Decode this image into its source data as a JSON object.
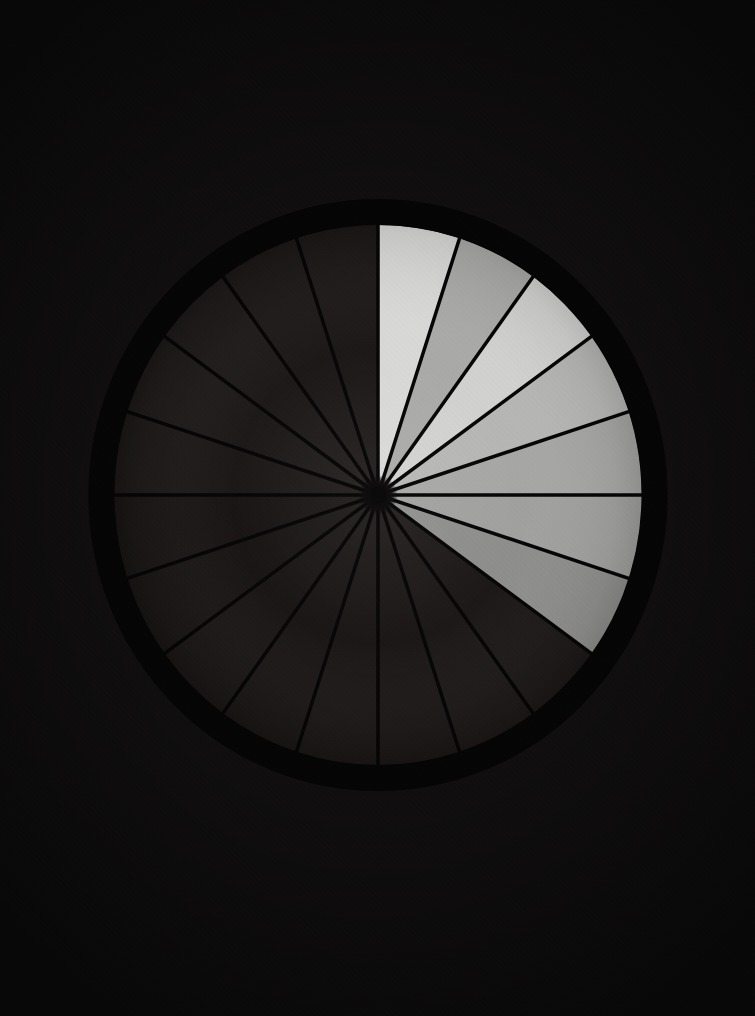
{
  "scene": {
    "title": "Radial sector wheel",
    "background_color": "#100e0e",
    "canvas_width": 755,
    "canvas_height": 1016
  },
  "wheel": {
    "center_x": 378,
    "center_y": 495,
    "rim_outer_rx": 289,
    "rim_outer_ry": 296,
    "rim_inner_rx": 264,
    "rim_inner_ry": 270,
    "rim_color": "#050404",
    "hub_radius": 9,
    "hub_color": "#060505",
    "sector_count": 20,
    "sector_span_degrees": 18,
    "spoke_color": "#050404",
    "spoke_width": 3.5,
    "dark_sector_color": "#1a1616"
  },
  "chart_data": {
    "type": "pie",
    "xlabel": "",
    "ylabel": "",
    "grid": false,
    "legend": "none",
    "total_sectors": 20,
    "slice_degrees": 18,
    "start_angle_degrees": -90,
    "direction": "clockwise",
    "categories": [
      "S1",
      "S2",
      "S3",
      "S4",
      "S5",
      "S6",
      "S7",
      "S8",
      "S9",
      "S10",
      "S11",
      "S12",
      "S13",
      "S14",
      "S15",
      "S16",
      "S17",
      "S18",
      "S19",
      "S20"
    ],
    "values": [
      18,
      18,
      18,
      18,
      18,
      18,
      18,
      18,
      18,
      18,
      18,
      18,
      18,
      18,
      18,
      18,
      18,
      18,
      18,
      18
    ],
    "lit_count": 7,
    "unlit_count": 13,
    "slices": [
      {
        "index": 1,
        "label": "S1",
        "start_deg": -90,
        "end_deg": -72,
        "lit": true,
        "color": "#d9d9d7",
        "brightness": 217
      },
      {
        "index": 2,
        "label": "S2",
        "start_deg": -72,
        "end_deg": -54,
        "lit": true,
        "color": "#a9a9a7",
        "brightness": 169
      },
      {
        "index": 3,
        "label": "S3",
        "start_deg": -54,
        "end_deg": -36,
        "lit": true,
        "color": "#d2d2d0",
        "brightness": 210
      },
      {
        "index": 4,
        "label": "S4",
        "start_deg": -36,
        "end_deg": -18,
        "lit": true,
        "color": "#b6b6b4",
        "brightness": 182
      },
      {
        "index": 5,
        "label": "S5",
        "start_deg": -18,
        "end_deg": 0,
        "lit": true,
        "color": "#a6a6a4",
        "brightness": 166
      },
      {
        "index": 6,
        "label": "S6",
        "start_deg": 0,
        "end_deg": 18,
        "lit": true,
        "color": "#a0a09e",
        "brightness": 160
      },
      {
        "index": 7,
        "label": "S7",
        "start_deg": 18,
        "end_deg": 36,
        "lit": true,
        "color": "#8d8d8b",
        "brightness": 141
      },
      {
        "index": 8,
        "label": "S8",
        "start_deg": 36,
        "end_deg": 54,
        "lit": false,
        "color": "#1a1616",
        "brightness": 26
      },
      {
        "index": 9,
        "label": "S9",
        "start_deg": 54,
        "end_deg": 72,
        "lit": false,
        "color": "#1a1616",
        "brightness": 26
      },
      {
        "index": 10,
        "label": "S10",
        "start_deg": 72,
        "end_deg": 90,
        "lit": false,
        "color": "#191515",
        "brightness": 25
      },
      {
        "index": 11,
        "label": "S11",
        "start_deg": 90,
        "end_deg": 108,
        "lit": false,
        "color": "#191515",
        "brightness": 25
      },
      {
        "index": 12,
        "label": "S12",
        "start_deg": 108,
        "end_deg": 126,
        "lit": false,
        "color": "#181414",
        "brightness": 24
      },
      {
        "index": 13,
        "label": "S13",
        "start_deg": 126,
        "end_deg": 144,
        "lit": false,
        "color": "#181414",
        "brightness": 24
      },
      {
        "index": 14,
        "label": "S14",
        "start_deg": 144,
        "end_deg": 162,
        "lit": false,
        "color": "#171313",
        "brightness": 23
      },
      {
        "index": 15,
        "label": "S15",
        "start_deg": 162,
        "end_deg": 180,
        "lit": false,
        "color": "#171313",
        "brightness": 23
      },
      {
        "index": 16,
        "label": "S16",
        "start_deg": 180,
        "end_deg": 198,
        "lit": false,
        "color": "#1a1616",
        "brightness": 26
      },
      {
        "index": 17,
        "label": "S17",
        "start_deg": 198,
        "end_deg": 216,
        "lit": false,
        "color": "#1b1717",
        "brightness": 27
      },
      {
        "index": 18,
        "label": "S18",
        "start_deg": 216,
        "end_deg": 234,
        "lit": false,
        "color": "#1b1717",
        "brightness": 27
      },
      {
        "index": 19,
        "label": "S19",
        "start_deg": 234,
        "end_deg": 252,
        "lit": false,
        "color": "#1a1616",
        "brightness": 26
      },
      {
        "index": 20,
        "label": "S20",
        "start_deg": 252,
        "end_deg": 270,
        "lit": false,
        "color": "#1a1616",
        "brightness": 26
      }
    ]
  }
}
